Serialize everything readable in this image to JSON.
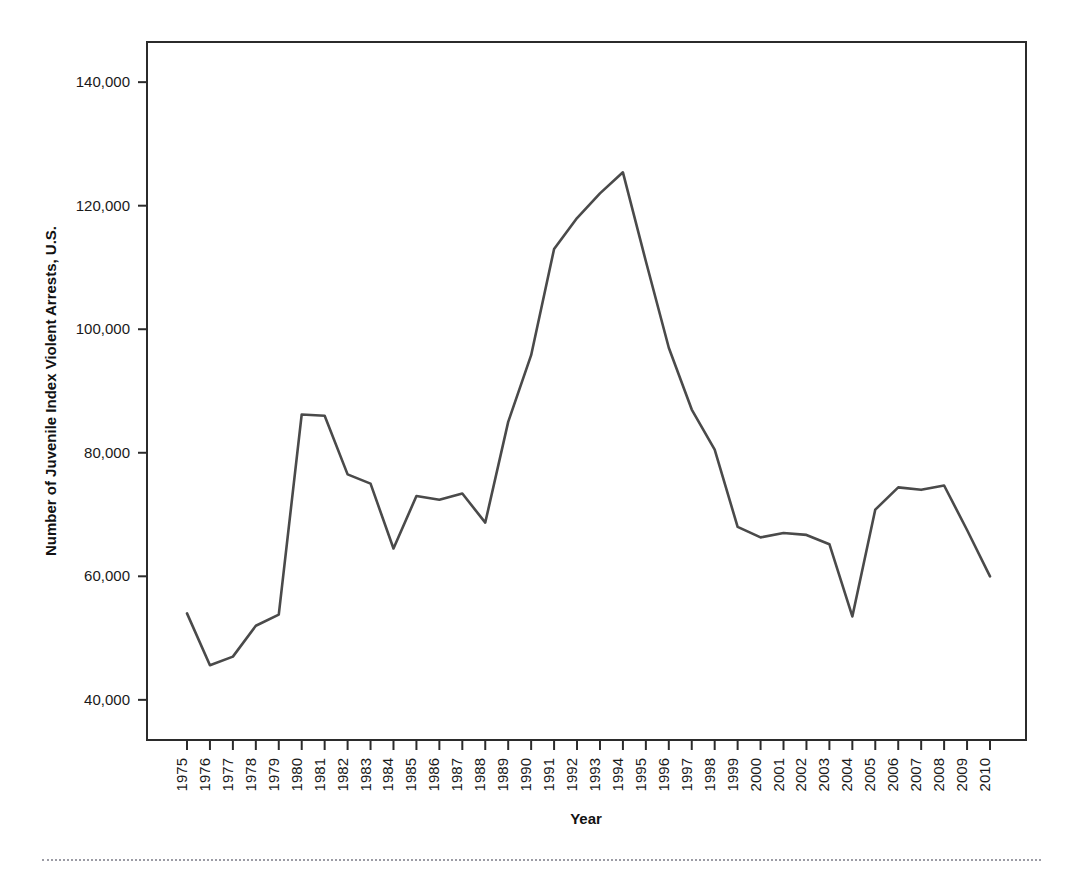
{
  "chart_data": {
    "type": "line",
    "title": "",
    "xlabel": "Year",
    "ylabel": "Number of Juvenile Index Violent Arrests, U.S.",
    "x": [
      1975,
      1976,
      1977,
      1978,
      1979,
      1980,
      1981,
      1982,
      1983,
      1984,
      1985,
      1986,
      1987,
      1988,
      1989,
      1990,
      1991,
      1992,
      1993,
      1994,
      1995,
      1996,
      1997,
      1998,
      1999,
      2000,
      2001,
      2002,
      2003,
      2004,
      2005,
      2006,
      2007,
      2008,
      2009,
      2010
    ],
    "values": [
      54000,
      45600,
      47000,
      52000,
      53800,
      86200,
      86000,
      76500,
      75000,
      64500,
      73000,
      72400,
      73400,
      68700,
      85000,
      95800,
      113000,
      118000,
      122000,
      125400,
      111000,
      97000,
      87000,
      80500,
      68000,
      66300,
      67000,
      66700,
      65200,
      53500,
      70800,
      74400,
      74000,
      74700,
      67500,
      60000
    ],
    "xtick_labels": [
      "1975",
      "1976",
      "1977",
      "1978",
      "1979",
      "1980",
      "1981",
      "1982",
      "1983",
      "1984",
      "1985",
      "1986",
      "1987",
      "1988",
      "1989",
      "1990",
      "1991",
      "1992",
      "1993",
      "1994",
      "1995",
      "1996",
      "1997",
      "1998",
      "1999",
      "2000",
      "2001",
      "2002",
      "2003",
      "2004",
      "2005",
      "2006",
      "2007",
      "2008",
      "2009",
      "2010"
    ],
    "ytick_values": [
      40000,
      60000,
      80000,
      100000,
      120000,
      140000
    ],
    "ytick_labels": [
      "40,000",
      "60,000",
      "80,000",
      "100,000",
      "120,000",
      "140,000"
    ],
    "ylim": [
      33500,
      146500
    ],
    "grid": false,
    "legend": false,
    "series_color": "#4a4a4a",
    "frame_color": "#2b2b2b",
    "background": "#ffffff"
  }
}
